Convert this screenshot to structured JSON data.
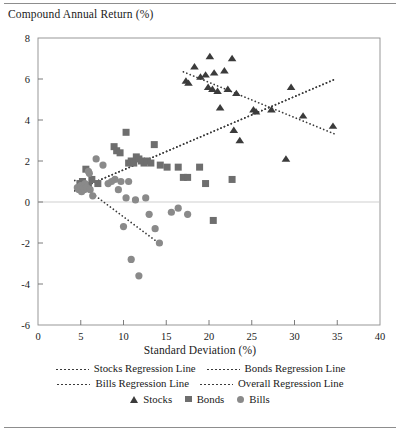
{
  "figure": {
    "y_axis_title": "Compound Annual Return (%)",
    "x_axis_title": "Standard Deviation (%)"
  },
  "legend": {
    "lines": [
      {
        "label": "Stocks Regression Line"
      },
      {
        "label": "Bonds Regression Line"
      },
      {
        "label": "Bills Regression Line"
      },
      {
        "label": "Overall Regression Line"
      }
    ],
    "markers": [
      {
        "label": "Stocks",
        "shape": "triangle-up"
      },
      {
        "label": "Bonds",
        "shape": "square"
      },
      {
        "label": "Bills",
        "shape": "circle"
      }
    ]
  },
  "colors": {
    "stocks_marker": "#3b3b3b",
    "bonds_marker": "#6e6e6e",
    "bills_marker": "#8a8a8a",
    "regression_line": "#3a3a3a",
    "axis": "#6d6d6d",
    "zero_line": "#c9c9c9",
    "frame": "#8d8d8d"
  },
  "chart_data": {
    "type": "scatter",
    "title": "",
    "xlabel": "Standard Deviation (%)",
    "ylabel": "Compound Annual Return (%)",
    "xlim": [
      0,
      40
    ],
    "ylim": [
      -6,
      8
    ],
    "xticks": [
      0,
      5,
      10,
      15,
      20,
      25,
      30,
      35,
      40
    ],
    "yticks": [
      -6,
      -4,
      -2,
      0,
      2,
      4,
      6,
      8
    ],
    "grid": false,
    "zero_reference_line": 0,
    "legend_position": "below",
    "series": [
      {
        "name": "Stocks",
        "marker": "triangle-up",
        "color": "#3b3b3b",
        "points": [
          [
            17.3,
            5.9
          ],
          [
            17.6,
            5.8
          ],
          [
            18.3,
            6.6
          ],
          [
            19.0,
            6.1
          ],
          [
            19.6,
            6.2
          ],
          [
            19.9,
            5.6
          ],
          [
            20.1,
            7.1
          ],
          [
            20.4,
            5.5
          ],
          [
            20.6,
            6.3
          ],
          [
            21.0,
            5.4
          ],
          [
            21.3,
            4.6
          ],
          [
            21.8,
            6.4
          ],
          [
            22.2,
            5.5
          ],
          [
            22.7,
            7.0
          ],
          [
            22.9,
            3.5
          ],
          [
            23.2,
            5.3
          ],
          [
            23.6,
            3.0
          ],
          [
            25.2,
            4.5
          ],
          [
            25.5,
            4.4
          ],
          [
            27.3,
            4.5
          ],
          [
            29.0,
            2.1
          ],
          [
            29.6,
            5.6
          ],
          [
            31.0,
            4.2
          ],
          [
            34.5,
            3.7
          ]
        ]
      },
      {
        "name": "Bonds",
        "marker": "square",
        "color": "#6e6e6e",
        "points": [
          [
            4.9,
            0.9
          ],
          [
            5.2,
            1.0
          ],
          [
            5.6,
            1.6
          ],
          [
            5.9,
            0.8
          ],
          [
            6.3,
            1.1
          ],
          [
            7.0,
            0.9
          ],
          [
            8.9,
            2.7
          ],
          [
            9.2,
            2.5
          ],
          [
            9.6,
            2.4
          ],
          [
            10.3,
            3.4
          ],
          [
            10.6,
            1.9
          ],
          [
            10.9,
            2.0
          ],
          [
            11.2,
            1.9
          ],
          [
            11.5,
            2.2
          ],
          [
            11.8,
            2.1
          ],
          [
            12.1,
            2.0
          ],
          [
            12.4,
            1.9
          ],
          [
            12.8,
            2.0
          ],
          [
            13.2,
            1.9
          ],
          [
            13.6,
            2.8
          ],
          [
            14.3,
            1.8
          ],
          [
            15.1,
            1.7
          ],
          [
            16.4,
            1.7
          ],
          [
            17.0,
            1.2
          ],
          [
            17.5,
            1.2
          ],
          [
            18.9,
            1.7
          ],
          [
            19.6,
            0.9
          ],
          [
            20.5,
            -0.9
          ],
          [
            22.7,
            1.1
          ]
        ]
      },
      {
        "name": "Bills",
        "marker": "circle",
        "color": "#8a8a8a",
        "points": [
          [
            4.6,
            0.7
          ],
          [
            4.8,
            0.6
          ],
          [
            5.0,
            0.8
          ],
          [
            5.1,
            0.5
          ],
          [
            5.3,
            0.7
          ],
          [
            5.4,
            0.6
          ],
          [
            5.5,
            0.9
          ],
          [
            5.7,
            0.7
          ],
          [
            5.9,
            1.5
          ],
          [
            6.0,
            1.4
          ],
          [
            6.1,
            0.6
          ],
          [
            6.4,
            0.3
          ],
          [
            6.8,
            2.1
          ],
          [
            7.6,
            1.8
          ],
          [
            8.2,
            0.9
          ],
          [
            8.6,
            1.0
          ],
          [
            9.0,
            1.1
          ],
          [
            9.4,
            0.6
          ],
          [
            9.7,
            1.0
          ],
          [
            10.0,
            -1.2
          ],
          [
            10.3,
            0.2
          ],
          [
            10.6,
            1.0
          ],
          [
            10.9,
            -2.8
          ],
          [
            11.4,
            0.1
          ],
          [
            11.8,
            -3.6
          ],
          [
            12.6,
            0.2
          ],
          [
            13.0,
            -0.6
          ],
          [
            13.7,
            -1.3
          ],
          [
            14.2,
            -2.0
          ],
          [
            15.6,
            -0.5
          ],
          [
            16.4,
            -0.3
          ],
          [
            17.5,
            -0.6
          ]
        ]
      }
    ],
    "regression_lines": [
      {
        "name": "Stocks Regression Line",
        "x": [
          17.0,
          34.8
        ],
        "y": [
          6.35,
          3.3
        ]
      },
      {
        "name": "Bonds Regression Line",
        "x": [
          4.3,
          34.8
        ],
        "y": [
          0.55,
          6.0
        ]
      },
      {
        "name": "Bills Regression Line",
        "x": [
          4.3,
          14.6
        ],
        "y": [
          1.05,
          -2.15
        ]
      },
      {
        "name": "Overall Regression Line",
        "x": [
          4.3,
          34.8
        ],
        "y": [
          0.55,
          6.0
        ]
      }
    ]
  }
}
